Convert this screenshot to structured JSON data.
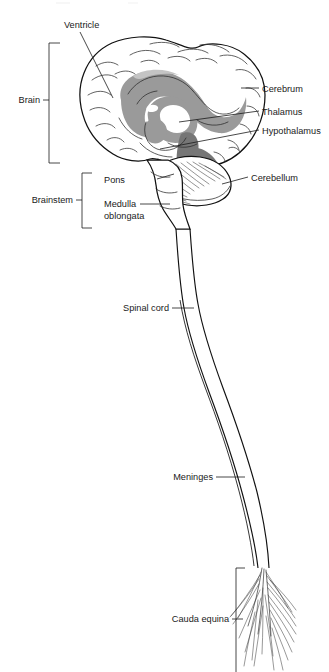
{
  "figure": {
    "type": "anatomical-diagram",
    "background_color": "#ffffff",
    "line_color": "#111111",
    "shade_colors": {
      "midgray": "#9a9a9a",
      "darkgray": "#767676",
      "lightgray": "#c4c4c4",
      "white": "#ffffff"
    }
  },
  "labels": {
    "ventricle": "Ventricle",
    "cerebrum": "Cerebrum",
    "thalamus": "Thalamus",
    "hypothalamus": "Hypothalamus",
    "cerebellum": "Cerebellum",
    "pons": "Pons",
    "medulla_line1": "Medulla",
    "medulla_line2": "oblongata",
    "spinal_cord": "Spinal cord",
    "meninges": "Meninges",
    "cauda_equina": "Cauda equina"
  },
  "brackets": {
    "brain": "Brain",
    "brainstem": "Brainstem",
    "cauda_equina": "Cauda equina"
  },
  "parts": [
    {
      "name": "Ventricle",
      "side": "left",
      "label_x": 64,
      "label_y": 28
    },
    {
      "name": "Cerebrum",
      "side": "right",
      "label_x": 262,
      "label_y": 89
    },
    {
      "name": "Thalamus",
      "side": "right",
      "label_x": 262,
      "label_y": 113
    },
    {
      "name": "Hypothalamus",
      "side": "right",
      "label_x": 262,
      "label_y": 132
    },
    {
      "name": "Cerebellum",
      "side": "right",
      "label_x": 251,
      "label_y": 179
    },
    {
      "name": "Pons",
      "side": "left",
      "label_x": 136,
      "label_y": 182
    },
    {
      "name": "Medulla oblongata",
      "side": "left",
      "label_x": 136,
      "label_y": 206
    },
    {
      "name": "Spinal cord",
      "side": "left",
      "label_x": 167,
      "label_y": 310
    },
    {
      "name": "Meninges",
      "side": "left",
      "label_x": 212,
      "label_y": 479
    },
    {
      "name": "Cauda equina",
      "side": "left",
      "label_x": 227,
      "label_y": 621
    }
  ],
  "groups": [
    {
      "name": "Brain",
      "span_top": 43,
      "span_bottom": 164,
      "label_y": 101
    },
    {
      "name": "Brainstem",
      "span_top": 173,
      "span_bottom": 228,
      "label_y": 201
    },
    {
      "name": "Cauda equina",
      "span_top": 568,
      "span_bottom": 672,
      "label_y": 621
    }
  ]
}
